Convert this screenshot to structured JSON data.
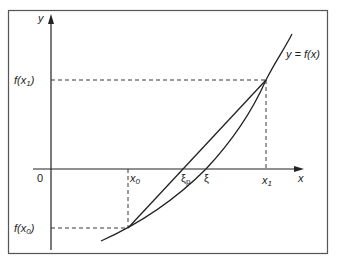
{
  "diagram": {
    "curve_label": "y = f(x)",
    "axes": {
      "x_label": "x",
      "y_label": "y",
      "origin_label": "0"
    },
    "x_ticks": [
      "x0",
      "ξp",
      "ξ",
      "x1"
    ],
    "y_ticks": [
      "f(x1)",
      "f(x0)"
    ],
    "labels": {
      "x0_main": "x",
      "x0_sub": "0",
      "x1_main": "x",
      "x1_sub": "1",
      "xi_p_main": "ξ",
      "xi_p_sub": "p",
      "xi": "ξ",
      "fx1_pre": "f(",
      "fx1_x": "x",
      "fx1_sub": "1",
      "fx1_post": ")",
      "fx0_pre": "f(",
      "fx0_x": "x",
      "fx0_sub": "0",
      "fx0_post": ")",
      "y_eq": "y = f(x)"
    },
    "colors": {
      "line": "#222222",
      "frame": "#444444",
      "background": "#ffffff"
    }
  }
}
